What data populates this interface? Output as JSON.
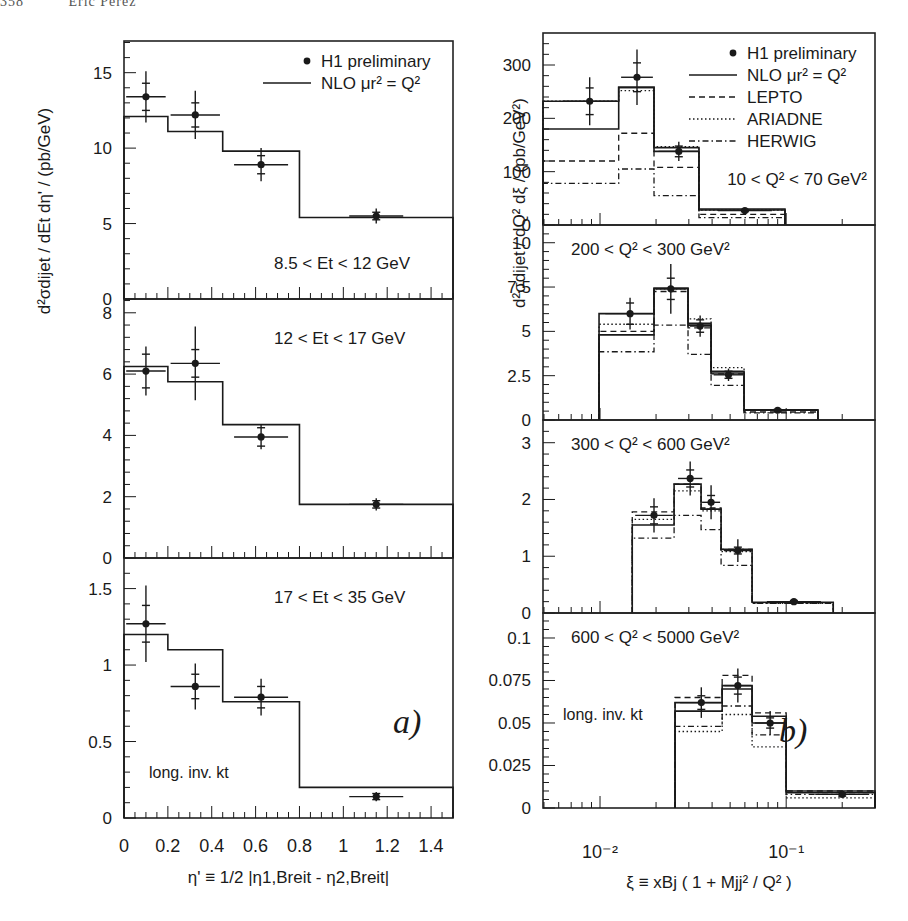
{
  "page_header": {
    "page_number": "358",
    "author": "Eric Perez"
  },
  "chart_data": [
    {
      "figure_label": "a)",
      "type": "step_histogram_with_points",
      "xlabel": "η' ≡ 1/2 |η1,Breit - η2,Breit|",
      "ylabel": "d²σdijet / dEt dη' / (pb/GeV)",
      "x_scale": "linear",
      "xlim": [
        0,
        1.5
      ],
      "x_ticks": [
        0,
        0.2,
        0.4,
        0.6,
        0.8,
        1,
        1.2,
        1.4
      ],
      "x_tick_labels": [
        "0",
        "0.2",
        "0.4",
        "0.6",
        "0.8",
        "1",
        "1.2",
        "1.4"
      ],
      "legend": [
        {
          "label": "H1 preliminary",
          "style": "marker"
        },
        {
          "label": "NLO  μr² = Q²",
          "style": "solid"
        }
      ],
      "corner_note": "long. inv. kt",
      "panels": [
        {
          "label": "8.5 < Et < 12 GeV",
          "ylim": [
            0,
            17.1
          ],
          "y_ticks": [
            0,
            5,
            10,
            15
          ],
          "bin_edges": [
            0,
            0.2,
            0.45,
            0.8,
            1.5
          ],
          "data": {
            "x": [
              0.1,
              0.325,
              0.625,
              1.15
            ],
            "y": [
              13.4,
              12.2,
              8.9,
              5.5
            ],
            "stat_err": [
              0.9,
              0.8,
              0.6,
              0.25
            ],
            "tot_err": [
              1.7,
              1.6,
              1.1,
              0.5
            ]
          },
          "series": [
            {
              "name": "NLO",
              "style": "solid",
              "values": [
                12.1,
                11.1,
                9.8,
                5.4
              ]
            }
          ]
        },
        {
          "label": "12 < Et < 17 GeV",
          "ylim": [
            0,
            8.45
          ],
          "y_ticks": [
            0,
            2,
            4,
            6,
            8
          ],
          "bin_edges": [
            0,
            0.2,
            0.45,
            0.8,
            1.5
          ],
          "data": {
            "x": [
              0.1,
              0.325,
              0.625,
              1.15
            ],
            "y": [
              6.1,
              6.35,
              3.95,
              1.75
            ],
            "stat_err": [
              0.55,
              0.45,
              0.3,
              0.12
            ],
            "tot_err": [
              0.8,
              1.2,
              0.4,
              0.2
            ]
          },
          "series": [
            {
              "name": "NLO",
              "style": "solid",
              "values": [
                6.25,
                5.75,
                4.35,
                1.75
              ]
            }
          ]
        },
        {
          "label": "17 < Et < 35 GeV",
          "ylim": [
            0,
            1.7
          ],
          "y_ticks": [
            0,
            0.5,
            1,
            1.5
          ],
          "y_tick_labels": [
            "0",
            "0.5",
            "1",
            "1.5"
          ],
          "bin_edges": [
            0,
            0.2,
            0.45,
            0.8,
            1.5
          ],
          "data": {
            "x": [
              0.1,
              0.325,
              0.625,
              1.15
            ],
            "y": [
              1.27,
              0.86,
              0.79,
              0.14
            ],
            "stat_err": [
              0.12,
              0.08,
              0.07,
              0.02
            ],
            "tot_err": [
              0.25,
              0.15,
              0.12,
              0.03
            ]
          },
          "series": [
            {
              "name": "NLO",
              "style": "solid",
              "values": [
                1.2,
                1.1,
                0.76,
                0.2
              ]
            }
          ]
        }
      ]
    },
    {
      "figure_label": "b)",
      "type": "step_histogram_with_points",
      "xlabel": "ξ ≡ xBj ( 1 + Mjj² / Q² )",
      "ylabel": "d²σdijet / dQ² dξ / (pb/GeV²)",
      "x_scale": "log",
      "xlim": [
        0.00494,
        0.3
      ],
      "x_tick_labels": [
        "10⁻²",
        "10⁻¹"
      ],
      "x_ticks": [
        0.01,
        0.1
      ],
      "legend": [
        {
          "label": "H1 preliminary",
          "style": "marker"
        },
        {
          "label": "NLO  μr² = Q²",
          "style": "solid"
        },
        {
          "label": "LEPTO",
          "style": "dashed"
        },
        {
          "label": "ARIADNE",
          "style": "dotted"
        },
        {
          "label": "HERWIG",
          "style": "dashdot"
        }
      ],
      "corner_note": "long. inv. kt",
      "panels": [
        {
          "label": "10 < Q² < 70 GeV²",
          "ylim": [
            0,
            360
          ],
          "y_ticks": [
            0,
            100,
            200,
            300
          ],
          "bin_edges": [
            0.00494,
            0.0126,
            0.0195,
            0.034,
            0.0985
          ],
          "data": {
            "x": [
              0.0088,
              0.0158,
              0.0265,
              0.06
            ],
            "y": [
              232,
              277,
              138,
              27
            ],
            "stat_err": [
              25,
              27,
              10,
              2
            ],
            "tot_err": [
              45,
              52,
              18,
              4
            ],
            "x_err_lo": [
              0.0,
              0.003,
              0,
              0
            ],
            "x_err_hi": [
              0.0,
              0.004,
              0,
              0
            ]
          },
          "series": [
            {
              "name": "NLO",
              "style": "solid",
              "values": [
                180,
                258,
                138,
                28
              ]
            },
            {
              "name": "NLO-upper",
              "style": "solid",
              "values": [
                232,
                258,
                145,
                30
              ]
            },
            {
              "name": "LEPTO",
              "style": "dashed",
              "values": [
                120,
                172,
                108,
                20
              ]
            },
            {
              "name": "ARIADNE",
              "style": "dotted",
              "values": [
                232,
                252,
                147,
                28
              ]
            },
            {
              "name": "HERWIG",
              "style": "dashdot",
              "values": [
                78,
                105,
                55,
                14
              ]
            }
          ]
        },
        {
          "label": "200 < Q² < 300 GeV²",
          "ylim": [
            0,
            11.0
          ],
          "y_ticks": [
            0,
            2.5,
            5,
            7.5,
            10
          ],
          "y_tick_labels": [
            "0",
            "2.5",
            "5",
            "7.5",
            "10"
          ],
          "bin_edges": [
            0.00988,
            0.0195,
            0.0297,
            0.0395,
            0.0594,
            0.148
          ],
          "data": {
            "x": [
              0.0145,
              0.024,
              0.0345,
              0.049,
              0.09
            ],
            "y": [
              6.0,
              7.4,
              5.3,
              2.55,
              0.55
            ],
            "stat_err": [
              0.6,
              0.6,
              0.35,
              0.2,
              0.05
            ],
            "tot_err": [
              0.9,
              1.4,
              0.6,
              0.35,
              0.1
            ]
          },
          "series": [
            {
              "name": "NLO",
              "style": "solid",
              "values": [
                4.8,
                7.4,
                5.35,
                2.65,
                0.55
              ]
            },
            {
              "name": "NLO-upper",
              "style": "solid",
              "values": [
                6.0,
                7.45,
                5.45,
                2.75,
                0.58
              ]
            },
            {
              "name": "LEPTO",
              "style": "dashed",
              "values": [
                5.0,
                7.25,
                5.2,
                2.6,
                0.45
              ]
            },
            {
              "name": "ARIADNE",
              "style": "dotted",
              "values": [
                5.4,
                7.4,
                5.7,
                2.95,
                0.55
              ]
            },
            {
              "name": "HERWIG",
              "style": "dashdot",
              "values": [
                3.85,
                5.35,
                3.7,
                1.95,
                0.4
              ]
            }
          ]
        },
        {
          "label": "300 < Q² < 600 GeV²",
          "ylim": [
            0,
            3.4
          ],
          "y_ticks": [
            0,
            1,
            2,
            3
          ],
          "bin_edges": [
            0.0149,
            0.025,
            0.0349,
            0.0447,
            0.0656,
            0.179
          ],
          "data": {
            "x": [
              0.0195,
              0.0305,
              0.0395,
              0.055,
              0.11
            ],
            "y": [
              1.72,
              2.37,
              1.95,
              1.1,
              0.2
            ],
            "stat_err": [
              0.15,
              0.15,
              0.12,
              0.06,
              0.02
            ],
            "tot_err": [
              0.3,
              0.3,
              0.3,
              0.2,
              0.03
            ]
          },
          "series": [
            {
              "name": "NLO",
              "style": "solid",
              "values": [
                1.55,
                2.27,
                1.83,
                1.12,
                0.19
              ]
            },
            {
              "name": "LEPTO",
              "style": "dashed",
              "values": [
                1.78,
                2.27,
                1.85,
                1.12,
                0.18
              ]
            },
            {
              "name": "ARIADNE",
              "style": "dotted",
              "values": [
                1.65,
                2.15,
                1.8,
                1.08,
                0.17
              ]
            },
            {
              "name": "HERWIG",
              "style": "dashdot",
              "values": [
                1.32,
                1.72,
                1.47,
                0.84,
                0.17
              ]
            }
          ]
        },
        {
          "label": "600 < Q² < 5000 GeV²",
          "ylim": [
            0,
            0.1147
          ],
          "y_ticks": [
            0,
            0.025,
            0.05,
            0.075,
            0.1
          ],
          "y_tick_labels": [
            "0",
            "0.025",
            "0.05",
            "0.075",
            "0.1"
          ],
          "bin_edges": [
            0.0253,
            0.0453,
            0.0656,
            0.1,
            0.3
          ],
          "data": {
            "x": [
              0.035,
              0.055,
              0.082,
              0.2
            ],
            "y": [
              0.062,
              0.072,
              0.05,
              0.008
            ],
            "stat_err": [
              0.004,
              0.005,
              0.003,
              0.001
            ],
            "tot_err": [
              0.009,
              0.01,
              0.007,
              0.0015
            ]
          },
          "series": [
            {
              "name": "NLO",
              "style": "solid",
              "values": [
                0.057,
                0.07,
                0.05,
                0.009
              ]
            },
            {
              "name": "NLO-upper",
              "style": "solid",
              "values": [
                0.062,
                0.072,
                0.054,
                0.01
              ]
            },
            {
              "name": "LEPTO",
              "style": "dashed",
              "values": [
                0.065,
                0.078,
                0.056,
                0.01
              ]
            },
            {
              "name": "ARIADNE",
              "style": "dotted",
              "values": [
                0.045,
                0.055,
                0.036,
                0.006
              ]
            },
            {
              "name": "HERWIG",
              "style": "dashdot",
              "values": [
                0.048,
                0.06,
                0.043,
                0.008
              ]
            }
          ]
        }
      ]
    }
  ],
  "layout": {
    "left": {
      "x0": 124,
      "x1": 453,
      "panels_y": [
        [
          41,
          299
        ],
        [
          299,
          558
        ],
        [
          558,
          818
        ]
      ]
    },
    "right": {
      "x0": 543,
      "x1": 875,
      "panels_y": [
        [
          33,
          225
        ],
        [
          225,
          420
        ],
        [
          420,
          613
        ],
        [
          613,
          808
        ]
      ]
    }
  },
  "colors": {
    "ink": "#1a1a1a",
    "background": "#ffffff",
    "frame": "#222222"
  }
}
